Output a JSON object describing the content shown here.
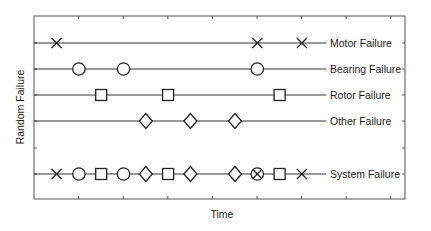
{
  "chart_data": {
    "type": "scatter",
    "title": "",
    "xlabel": "Time",
    "ylabel": "Random Failure",
    "grid": false,
    "legend": "inline row labels at right",
    "x_ticks": [
      1,
      2,
      3,
      4,
      5,
      6,
      7,
      8
    ],
    "xlim": [
      0,
      8.5
    ],
    "series": [
      {
        "name": "Motor Failure",
        "marker": "x",
        "x": [
          0.5,
          5.0,
          6.0
        ]
      },
      {
        "name": "Bearing Failure",
        "marker": "circle",
        "x": [
          1.0,
          2.0,
          5.0
        ]
      },
      {
        "name": "Rotor Failure",
        "marker": "square",
        "x": [
          1.5,
          3.0,
          5.5
        ]
      },
      {
        "name": "Other Failure",
        "marker": "diamond",
        "x": [
          2.5,
          3.5,
          4.5
        ]
      },
      {
        "name": "System Failure",
        "marker": "mixed",
        "x": [
          0.5,
          1.0,
          1.5,
          2.0,
          2.5,
          3.0,
          3.5,
          4.5,
          5.0,
          5.5,
          6.0
        ],
        "markers": [
          "x",
          "circle",
          "square",
          "circle",
          "diamond",
          "square",
          "diamond",
          "diamond",
          "circle-x",
          "square",
          "x"
        ]
      }
    ]
  },
  "labels": {
    "xlabel": "Time",
    "ylabel": "Random Failure",
    "rows": [
      "Motor Failure",
      "Bearing Failure",
      "Rotor Failure",
      "Other Failure",
      "System Failure"
    ]
  }
}
